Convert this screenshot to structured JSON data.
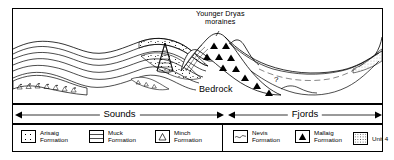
{
  "figure": {
    "annotations": {
      "younger_dryas": "Younger Dryas\nmoraines",
      "younger_dryas_line1": "Younger Dryas",
      "younger_dryas_line2": "moraines",
      "bedrock": "Bedrock",
      "uncertainty": "?"
    }
  },
  "scale_bar": {
    "segments": [
      {
        "label": "Sounds",
        "arrows": "double"
      },
      {
        "label": "Fjords",
        "arrows": "double"
      }
    ]
  },
  "legend": {
    "left_group": [
      {
        "label_line1": "Arisaig",
        "label_line2": "Formation",
        "pattern": "stipple-coarse-dots"
      },
      {
        "label_line1": "Muck",
        "label_line2": "Formation",
        "pattern": "horizontal-lines"
      },
      {
        "label_line1": "Minch",
        "label_line2": "Formation",
        "pattern": "open-triangle"
      }
    ],
    "right_group": [
      {
        "label_line1": "Nevis",
        "label_line2": "Formation",
        "pattern": "wavy-line"
      },
      {
        "label_line1": "Mallaig",
        "label_line2": "Formation",
        "pattern": "filled-triangle"
      },
      {
        "label_line1": "Unit 4",
        "label_line2": "",
        "pattern": "fine-stipple"
      }
    ]
  },
  "colors": {
    "ink": "#000000",
    "paper": "#ffffff",
    "dashed_bed": "#444444"
  }
}
